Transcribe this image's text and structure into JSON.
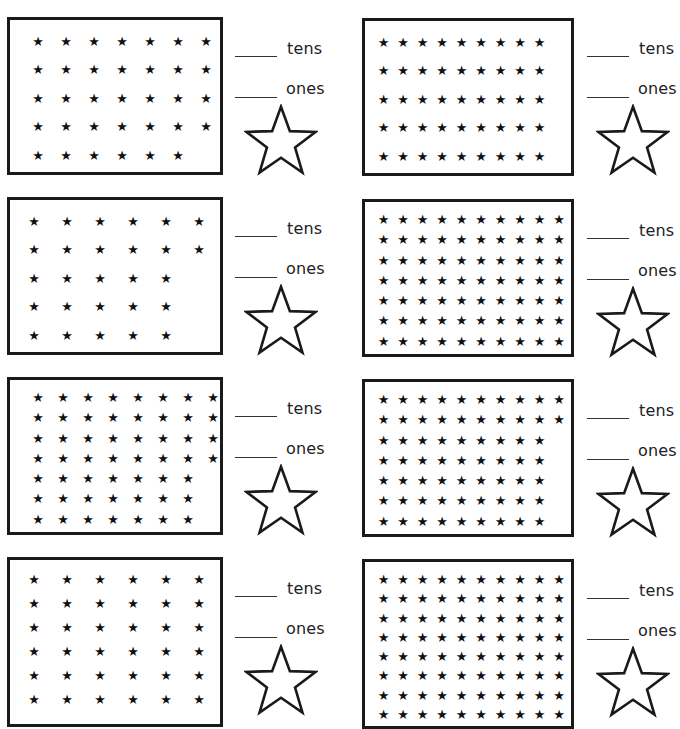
{
  "header": {
    "clipped_instruction": "the stars"
  },
  "labels": {
    "tens": "tens",
    "ones": "ones"
  },
  "problems": [
    {
      "id": 1,
      "rows": [
        7,
        7,
        7,
        7,
        6
      ],
      "cols": 7,
      "total": 34
    },
    {
      "id": 2,
      "rows": [
        9,
        9,
        9,
        9,
        9
      ],
      "cols": 9,
      "total": 45
    },
    {
      "id": 3,
      "rows": [
        6,
        6,
        5,
        5,
        5
      ],
      "cols": 6,
      "total": 27
    },
    {
      "id": 4,
      "rows": [
        10,
        10,
        10,
        10,
        10,
        10,
        10
      ],
      "cols": 10,
      "total": 70
    },
    {
      "id": 5,
      "rows": [
        8,
        8,
        8,
        8,
        7,
        7,
        7
      ],
      "cols": 8,
      "total": 53
    },
    {
      "id": 6,
      "rows": [
        10,
        10,
        9,
        9,
        9,
        9,
        9
      ],
      "cols": 10,
      "total": 65
    },
    {
      "id": 7,
      "rows": [
        6,
        6,
        6,
        6,
        6,
        6
      ],
      "cols": 6,
      "visible_rows_cropped": true
    },
    {
      "id": 8,
      "rows": [
        10,
        10,
        10,
        10,
        10,
        10,
        10,
        10
      ],
      "cols": 10,
      "visible_rows_cropped": true
    }
  ],
  "star_glyph": "★"
}
